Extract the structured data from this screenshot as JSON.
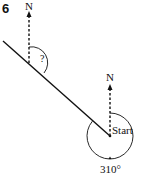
{
  "question": {
    "number": "6"
  },
  "labels": {
    "north_top": "N",
    "north_start": "N",
    "unknown_angle": "?",
    "start": "Start",
    "bearing": "310°"
  },
  "colors": {
    "stroke": "#111111",
    "background": "#ffffff"
  },
  "diagram": {
    "start_point": [
      110,
      136
    ],
    "end_point_on_north_line": [
      29,
      63
    ],
    "bearing_degrees": 310
  }
}
